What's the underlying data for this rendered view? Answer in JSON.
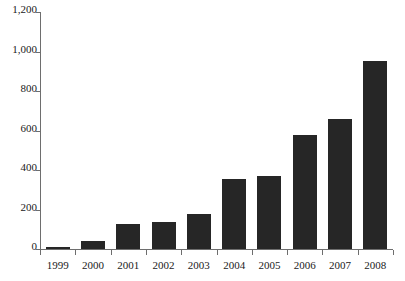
{
  "chart_data": {
    "type": "bar",
    "title": "",
    "subtitle": "",
    "xlabel": "",
    "ylabel": "",
    "categories": [
      "1999",
      "2000",
      "2001",
      "2002",
      "2003",
      "2004",
      "2005",
      "2006",
      "2007",
      "2008"
    ],
    "values": [
      10,
      40,
      125,
      135,
      178,
      355,
      370,
      575,
      660,
      950
    ],
    "series": [
      {
        "name": "",
        "values": [
          10,
          40,
          125,
          135,
          178,
          355,
          370,
          575,
          660,
          950
        ]
      }
    ],
    "ylim": [
      0,
      1200
    ],
    "ytick_values": [
      0,
      200,
      400,
      600,
      800,
      1000,
      1200
    ],
    "ytick_labels": [
      "0",
      "200",
      "400",
      "600",
      "800",
      "1,000",
      "1,200"
    ],
    "xtick_labels": [
      "1999",
      "2000",
      "2001",
      "2002",
      "2003",
      "2004",
      "2005",
      "2006",
      "2007",
      "2008"
    ],
    "grid": false,
    "legend": false,
    "legend_position": "none",
    "annotations": [],
    "bar_color": "#262626",
    "axis_color": "#6e6e6e",
    "background_color": "#ffffff"
  }
}
